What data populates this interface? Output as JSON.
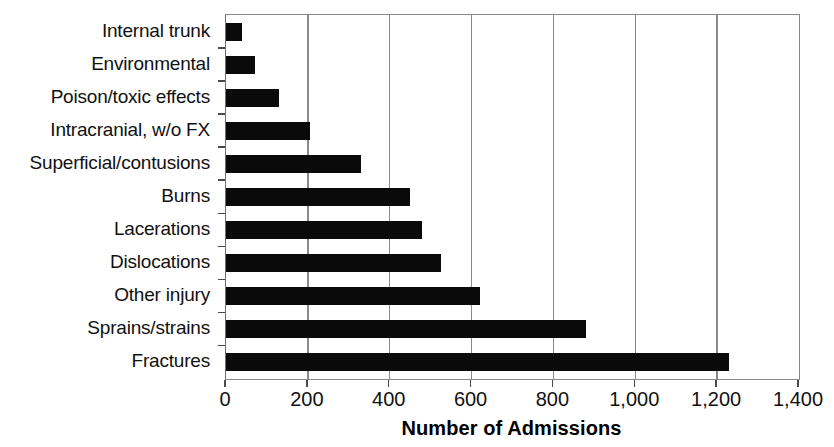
{
  "chart_data": {
    "type": "bar",
    "orientation": "horizontal",
    "title": "",
    "xlabel": "Number of Admissions",
    "ylabel": "",
    "categories": [
      "Internal trunk",
      "Environmental",
      "Poison/toxic effects",
      "Intracranial, w/o FX",
      "Superficial/contusions",
      "Burns",
      "Lacerations",
      "Dislocations",
      "Other injury",
      "Sprains/strains",
      "Fractures"
    ],
    "values": [
      40,
      70,
      130,
      205,
      330,
      450,
      480,
      525,
      620,
      880,
      1230
    ],
    "xlim": [
      0,
      1400
    ],
    "xticks": [
      0,
      200,
      400,
      600,
      800,
      1000,
      1200,
      1400
    ],
    "xtick_labels": [
      "0",
      "200",
      "400",
      "600",
      "800",
      "1,000",
      "1,200",
      "1,400"
    ],
    "grid": "vertical",
    "legend": "none",
    "bar_color": "#0a0a0a",
    "axis_color": "#8a8a8a"
  }
}
